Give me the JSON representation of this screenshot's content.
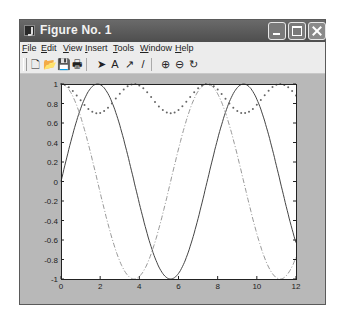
{
  "window": {
    "title": "Figure No. 1",
    "controls": [
      "minimize",
      "maximize",
      "close"
    ]
  },
  "menu": [
    {
      "label": "File",
      "u": "F"
    },
    {
      "label": "Edit",
      "u": "E"
    },
    {
      "label": "View",
      "u": "V"
    },
    {
      "label": "Insert",
      "u": "I"
    },
    {
      "label": "Tools",
      "u": "T"
    },
    {
      "label": "Window",
      "u": "W"
    },
    {
      "label": "Help",
      "u": "H"
    }
  ],
  "toolbar": [
    {
      "name": "new-figure",
      "glyph": "🗋"
    },
    {
      "name": "open-file",
      "glyph": "📂"
    },
    {
      "name": "save",
      "glyph": "💾"
    },
    {
      "name": "print",
      "glyph": "🖶"
    },
    {
      "name": "select-arrow",
      "glyph": "➤"
    },
    {
      "name": "insert-text",
      "glyph": "A"
    },
    {
      "name": "insert-arrow",
      "glyph": "↗"
    },
    {
      "name": "insert-line",
      "glyph": "/"
    },
    {
      "name": "zoom-in",
      "glyph": "⊕"
    },
    {
      "name": "zoom-out",
      "glyph": "⊖"
    },
    {
      "name": "rotate-3d",
      "glyph": "↻"
    }
  ],
  "colors": {
    "titlebar": "#555555",
    "figure_bg": "#b8b8b8",
    "axes_bg": "#ffffff",
    "line": "#444444",
    "dashdot": "#999999",
    "dotted": "#666666"
  },
  "chart_data": {
    "type": "line",
    "title": "",
    "xlabel": "",
    "ylabel": "",
    "xlim": [
      0,
      12
    ],
    "ylim": [
      -1,
      1
    ],
    "xticks": [
      0,
      2,
      4,
      6,
      8,
      10,
      12
    ],
    "yticks": [
      -1,
      -0.8,
      -0.6,
      -0.4,
      -0.2,
      0,
      0.2,
      0.4,
      0.6,
      0.8,
      1
    ],
    "grid": false,
    "legend": null,
    "omega": 0.842,
    "series": [
      {
        "name": "sin",
        "style": "solid",
        "formula": "sin(0.842x)",
        "x": [
          0,
          1,
          2,
          3,
          4,
          5,
          6,
          7,
          8,
          9,
          10,
          11,
          12
        ],
        "y": [
          0,
          0.75,
          0.99,
          0.58,
          -0.23,
          -0.86,
          -0.95,
          -0.37,
          0.44,
          0.96,
          0.85,
          0.14,
          -0.63
        ]
      },
      {
        "name": "cos",
        "style": "dash-dot",
        "formula": "cos(0.842x)",
        "x": [
          0,
          1,
          2,
          3,
          4,
          5,
          6,
          7,
          8,
          9,
          10,
          11,
          12
        ],
        "y": [
          1,
          0.67,
          -0.11,
          -0.81,
          -0.97,
          -0.5,
          0.33,
          0.93,
          0.9,
          0.27,
          -0.53,
          -0.99,
          -0.78
        ]
      },
      {
        "name": "envelope",
        "style": "dotted",
        "formula": "0.85+0.15cos(1.684x)",
        "x": [
          0,
          1,
          2,
          3,
          4,
          5,
          6,
          7,
          8,
          9,
          10,
          11,
          12
        ],
        "y": [
          1,
          0.83,
          0.7,
          0.82,
          0.98,
          0.88,
          0.72,
          0.78,
          0.96,
          0.92,
          0.71,
          0.75,
          0.93
        ]
      }
    ]
  }
}
